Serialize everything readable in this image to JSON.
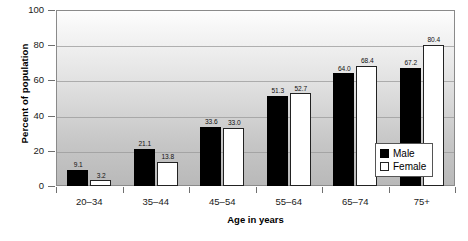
{
  "chart_data": {
    "type": "bar",
    "title": "",
    "xlabel": "Age in years",
    "ylabel": "Percent of population",
    "categories": [
      "20–34",
      "35–44",
      "45–54",
      "55–64",
      "65–74",
      "75+"
    ],
    "series": [
      {
        "name": "Male",
        "values": [
          9.1,
          21.1,
          33.6,
          51.3,
          64.0,
          67.2
        ],
        "labels": [
          "9.1",
          "21.1",
          "33.6",
          "51.3",
          "64.0",
          "67.2"
        ],
        "color": "#000000"
      },
      {
        "name": "Female",
        "values": [
          3.2,
          13.8,
          33.0,
          52.7,
          68.4,
          80.4
        ],
        "labels": [
          "3.2",
          "13.8",
          "33.0",
          "52.7",
          "68.4",
          "80.4"
        ],
        "color": "#ffffff"
      }
    ],
    "ylim": [
      0,
      100
    ],
    "yticks": [
      0,
      20,
      40,
      60,
      80,
      100
    ],
    "ytick_labels": [
      "0",
      "20",
      "40",
      "60",
      "80",
      "100"
    ],
    "grid": "horizontal",
    "legend_position": "bottom-right",
    "legend_entries": [
      "Male",
      "Female"
    ]
  }
}
